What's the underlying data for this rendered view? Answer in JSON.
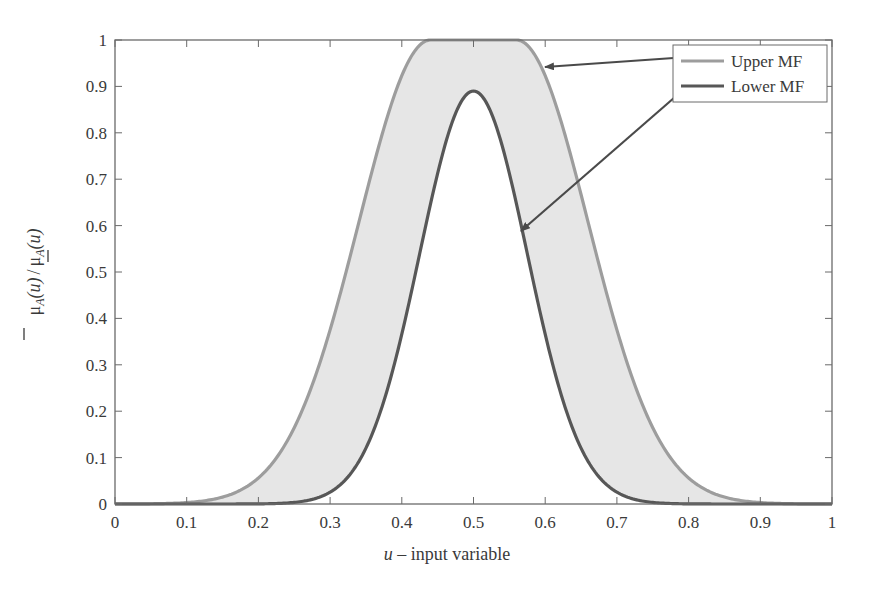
{
  "chart_data": {
    "type": "area",
    "title": "",
    "xlabel": "u – input variable",
    "xlabel_italic_part": "u",
    "xlabel_rest": " – input variable",
    "ylabel": "μ̄_A(u) / μ_A(u)",
    "xlim": [
      0,
      1
    ],
    "ylim": [
      0,
      1
    ],
    "xticks": [
      0,
      0.1,
      0.2,
      0.3,
      0.4,
      0.5,
      0.6,
      0.7,
      0.8,
      0.9,
      1
    ],
    "xtick_labels": [
      "0",
      "0.1",
      "0.2",
      "0.3",
      "0.4",
      "0.5",
      "0.6",
      "0.7",
      "0.8",
      "0.9",
      "1"
    ],
    "yticks": [
      0,
      0.1,
      0.2,
      0.3,
      0.4,
      0.5,
      0.6,
      0.7,
      0.8,
      0.9,
      1
    ],
    "ytick_labels": [
      "0",
      "0.1",
      "0.2",
      "0.3",
      "0.4",
      "0.5",
      "0.6",
      "0.7",
      "0.8",
      "0.9",
      "1"
    ],
    "grid": false,
    "legend_position": "upper right",
    "series": [
      {
        "name": "Upper MF",
        "shape": "gaussian-flat-top",
        "plateau": [
          0.44,
          0.56
        ],
        "sigma": 0.1,
        "height": 1.0,
        "color": "#9a9a9a",
        "x": [
          0,
          0.1,
          0.15,
          0.2,
          0.25,
          0.3,
          0.35,
          0.4,
          0.44,
          0.5,
          0.56,
          0.6,
          0.65,
          0.7,
          0.75,
          0.8,
          0.85,
          0.9,
          1
        ],
        "values": [
          0.0,
          0.01,
          0.05,
          0.12,
          0.24,
          0.4,
          0.59,
          0.78,
          1.0,
          1.0,
          1.0,
          0.92,
          0.74,
          0.51,
          0.31,
          0.15,
          0.06,
          0.02,
          0.0
        ]
      },
      {
        "name": "Lower MF",
        "shape": "gaussian",
        "center": 0.5,
        "sigma": 0.075,
        "height": 0.89,
        "color": "#555555",
        "x": [
          0,
          0.2,
          0.25,
          0.3,
          0.35,
          0.4,
          0.45,
          0.5,
          0.55,
          0.6,
          0.65,
          0.7,
          0.75,
          0.8,
          1
        ],
        "values": [
          0.0,
          0.0,
          0.03,
          0.08,
          0.2,
          0.36,
          0.71,
          0.89,
          0.71,
          0.36,
          0.2,
          0.08,
          0.03,
          0.0,
          0.0
        ]
      }
    ],
    "fill_between": {
      "color": "#e8e8e8",
      "description": "footprint of uncertainty between Upper MF and Lower MF"
    },
    "annotations": [
      {
        "type": "arrow",
        "from": "legend Upper MF",
        "to": [
          0.59,
          0.94
        ]
      },
      {
        "type": "arrow",
        "from": "legend Lower MF",
        "to": [
          0.56,
          0.59
        ]
      }
    ]
  },
  "legend": {
    "upper_label": "Upper MF",
    "lower_label": "Lower MF"
  },
  "axes": {
    "xlabel_italic": "u",
    "xlabel_rest": " – input variable",
    "ylabel_mu": "μ",
    "ylabel_sub": "A",
    "ylabel_arg": "(u)",
    "ylabel_sep": "/"
  }
}
